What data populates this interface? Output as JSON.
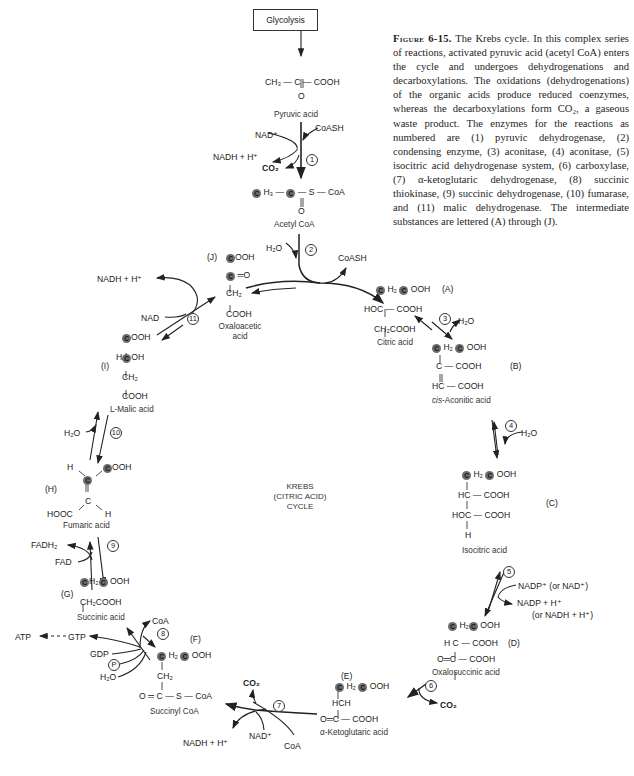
{
  "caption": {
    "figure_label": "Figure 6-15.",
    "text": " The Krebs cycle. In this complex series of reactions, activated pyruvic acid (acetyl CoA) enters the cycle and undergoes dehydrogenations and decarboxylations. The oxidations (dehydrogenations) of the organic acids produce reduced coenzymes, whereas the decarboxylations form CO₂, a gaseous waste product. The enzymes for the reactions as numbered are (1) pyruvic dehydrogenase, (2) condensing enzyme, (3) aconitase, (4) aconitase, (5) isocitric acid dehydrogenase system, (6) carboxylase, (7) α-ketoglutaric dehydrogenase, (8) succinic thiokinase, (9) succinic dehydrogenase, (10) fumarase, and (11) malic dehydrogenase. The intermediate substances are lettered (A) through (J)."
  },
  "center_label": [
    "KREBS",
    "(CITRIC ACID)",
    "CYCLE"
  ],
  "entry": {
    "glycolysis": "Glycolysis",
    "pyruvic_formula": "CH₃ — C — COOH",
    "pyruvic_o": "O",
    "pyruvic_name": "Pyruvic acid",
    "nad_plus": "NAD⁺",
    "coash": "CoASH",
    "nadh": "NADH + H⁺",
    "co2": "CO₂",
    "acetyl_formula_tail": "H₃ —",
    "acetyl_formula_end": "— S — CoA",
    "acetyl_o": "O",
    "acetyl_name": "Acetyl CoA",
    "h2o": "H₂O",
    "coash2": "CoASH"
  },
  "enzymes": [
    "1",
    "2",
    "3",
    "4",
    "5",
    "6",
    "7",
    "8",
    "9",
    "10",
    "11"
  ],
  "intermediates": {
    "A": {
      "letter": "(A)",
      "name": "Citric acid",
      "lines": [
        "H₂",
        "OOH",
        "HOC — COOH",
        "CH₂COOH"
      ]
    },
    "B": {
      "letter": "(B)",
      "name_italic": "cis",
      "name": "-Aconitic acid",
      "lines": [
        "H₂",
        "OOH",
        "C — COOH",
        "HC — COOH"
      ]
    },
    "C": {
      "letter": "(C)",
      "name": "Isocitric acid",
      "lines": [
        "H₂",
        "OOH",
        "HC — COOH",
        "HOC — COOH",
        "H"
      ]
    },
    "D": {
      "letter": "(D)",
      "name": "Oxalosuccinic acid",
      "lines": [
        "H₂",
        "OOH",
        "H C — COOH",
        "O═C — COOH"
      ]
    },
    "E": {
      "letter": "(E)",
      "name": "α-Ketoglutaric acid",
      "lines": [
        "H₂",
        "OOH",
        "HCH",
        "O═C — COOH"
      ]
    },
    "F": {
      "letter": "(F)",
      "name": "Succinyl CoA",
      "lines": [
        "H₂",
        "OOH",
        "CH₂",
        "O ═ C — S — CoA"
      ]
    },
    "G": {
      "letter": "(G)",
      "name": "Succinic acid",
      "lines": [
        "H₂",
        "OOH",
        "CH₂COOH"
      ]
    },
    "H": {
      "letter": "(H)",
      "name": "Fumaric acid",
      "lines": [
        "H",
        "OOH",
        "C",
        "HOOC",
        "H"
      ]
    },
    "I": {
      "letter": "(I)",
      "name": "L-Malic acid",
      "lines": [
        "OOH",
        "H",
        "OH",
        "CH₂",
        "COOH"
      ]
    },
    "J": {
      "letter": "(J)",
      "name": "Oxaloacetic acid",
      "lines": [
        "OOH",
        "═O",
        "CH₂",
        "COOH"
      ]
    }
  },
  "cofactors": {
    "h2o_3": "H₂O",
    "h2o_4": "H₂O",
    "nadp_plus": "NADP⁺  (or NAD⁺)",
    "nadp_h": "NADP + H⁺",
    "nadh_alt": "(or NADH + H⁺)",
    "co2_6": "CO₂",
    "co2_7": "CO₂",
    "nad_7": "NAD⁺",
    "coa_7": "CoA",
    "nadh_7": "NADH + H⁺",
    "coa_8": "CoA",
    "gdp": "GDP",
    "p": "P",
    "h2o_8": "H₂O",
    "gtp": "GTP",
    "atp": "ATP",
    "fadh2": "FADH₂",
    "fad": "FAD",
    "h2o_10": "H₂O",
    "nadh_11": "NADH + H⁺",
    "nad_11": "NAD"
  },
  "labeled_carbon": "C"
}
